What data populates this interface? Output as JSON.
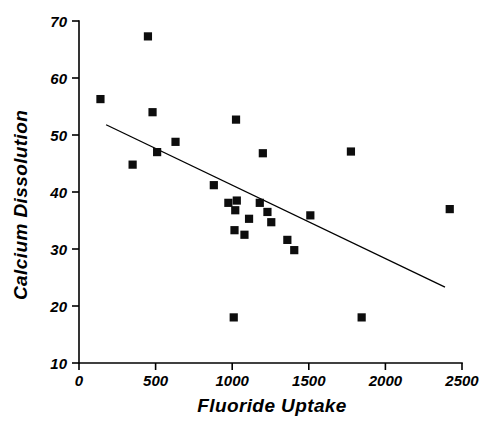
{
  "chart_data": {
    "type": "scatter",
    "title": "",
    "xlabel": "Fluoride Uptake",
    "ylabel": "Calcium Dissolution",
    "xlim": [
      0,
      2500
    ],
    "ylim": [
      10,
      70
    ],
    "xticks": [
      0,
      500,
      1000,
      1500,
      2000,
      2500
    ],
    "yticks": [
      10,
      20,
      30,
      40,
      50,
      60,
      70
    ],
    "xtick_labels": [
      "0",
      "500",
      "1000",
      "1500",
      "2000",
      "2500"
    ],
    "ytick_labels": [
      "10",
      "20",
      "30",
      "40",
      "50",
      "60",
      "70"
    ],
    "grid": false,
    "legend": null,
    "marker_style": "filled-square",
    "marker_color": "#0d0d0d",
    "points": [
      {
        "x": 140,
        "y": 56.3
      },
      {
        "x": 350,
        "y": 44.8
      },
      {
        "x": 450,
        "y": 67.3
      },
      {
        "x": 480,
        "y": 54.0
      },
      {
        "x": 510,
        "y": 47.0
      },
      {
        "x": 630,
        "y": 48.8
      },
      {
        "x": 880,
        "y": 41.2
      },
      {
        "x": 975,
        "y": 38.1
      },
      {
        "x": 1010,
        "y": 18.0
      },
      {
        "x": 1015,
        "y": 33.3
      },
      {
        "x": 1020,
        "y": 36.8
      },
      {
        "x": 1025,
        "y": 52.7
      },
      {
        "x": 1030,
        "y": 38.5
      },
      {
        "x": 1080,
        "y": 32.5
      },
      {
        "x": 1110,
        "y": 35.3
      },
      {
        "x": 1180,
        "y": 38.1
      },
      {
        "x": 1200,
        "y": 46.8
      },
      {
        "x": 1230,
        "y": 36.5
      },
      {
        "x": 1255,
        "y": 34.7
      },
      {
        "x": 1360,
        "y": 31.6
      },
      {
        "x": 1405,
        "y": 29.8
      },
      {
        "x": 1510,
        "y": 35.9
      },
      {
        "x": 1775,
        "y": 47.1
      },
      {
        "x": 1845,
        "y": 18.0
      },
      {
        "x": 2420,
        "y": 37.0
      }
    ],
    "fit_line": {
      "name": "least-squares regression line",
      "x_start": 177,
      "y_start": 51.8,
      "x_end": 2389,
      "y_end": 23.3
    }
  },
  "axes": {
    "y_title": "Calcium Dissolution",
    "x_title": "Fluoride Uptake"
  }
}
